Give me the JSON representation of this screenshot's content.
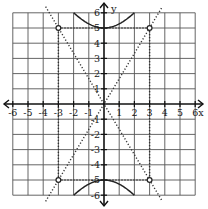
{
  "figure": {
    "x_axis_label": "x",
    "y_axis_label": "y",
    "x_ticks": [
      "-6",
      "-5",
      "-4",
      "-3",
      "-2",
      "-1",
      "1",
      "2",
      "3",
      "4",
      "5",
      "6"
    ],
    "y_ticks": [
      "6",
      "5",
      "4",
      "3",
      "2",
      "1",
      "-1",
      "-2",
      "-3",
      "-4",
      "-5",
      "-6"
    ],
    "x_range": [
      -6,
      6
    ],
    "y_range": [
      -6,
      6
    ],
    "grid": true,
    "colors": {
      "axis": "#111111",
      "grid": "#555555",
      "curve": "#222222",
      "asymptote": "#333333"
    }
  },
  "chart_data": {
    "type": "line",
    "title": "",
    "xlabel": "x",
    "ylabel": "y",
    "xlim": [
      -6,
      6
    ],
    "ylim": [
      -6,
      6
    ],
    "grid": true,
    "series": [
      {
        "name": "hyperbola upper branch",
        "equation": "y = 5*sqrt(1 + x^2/9)",
        "vertex": [
          0,
          5
        ],
        "style": "solid"
      },
      {
        "name": "hyperbola lower branch",
        "equation": "y = -5*sqrt(1 + x^2/9)",
        "vertex": [
          0,
          -5
        ],
        "style": "solid"
      },
      {
        "name": "asymptote 1",
        "equation": "y = (5/3)x",
        "style": "dotted"
      },
      {
        "name": "asymptote 2",
        "equation": "y = -(5/3)x",
        "style": "dotted"
      },
      {
        "name": "fundamental rectangle",
        "corners": [
          [
            -3,
            5
          ],
          [
            3,
            5
          ],
          [
            3,
            -5
          ],
          [
            -3,
            -5
          ]
        ],
        "style": "dotted"
      }
    ],
    "points": [
      [
        -3,
        5
      ],
      [
        3,
        5
      ],
      [
        3,
        -5
      ],
      [
        -3,
        -5
      ]
    ]
  }
}
